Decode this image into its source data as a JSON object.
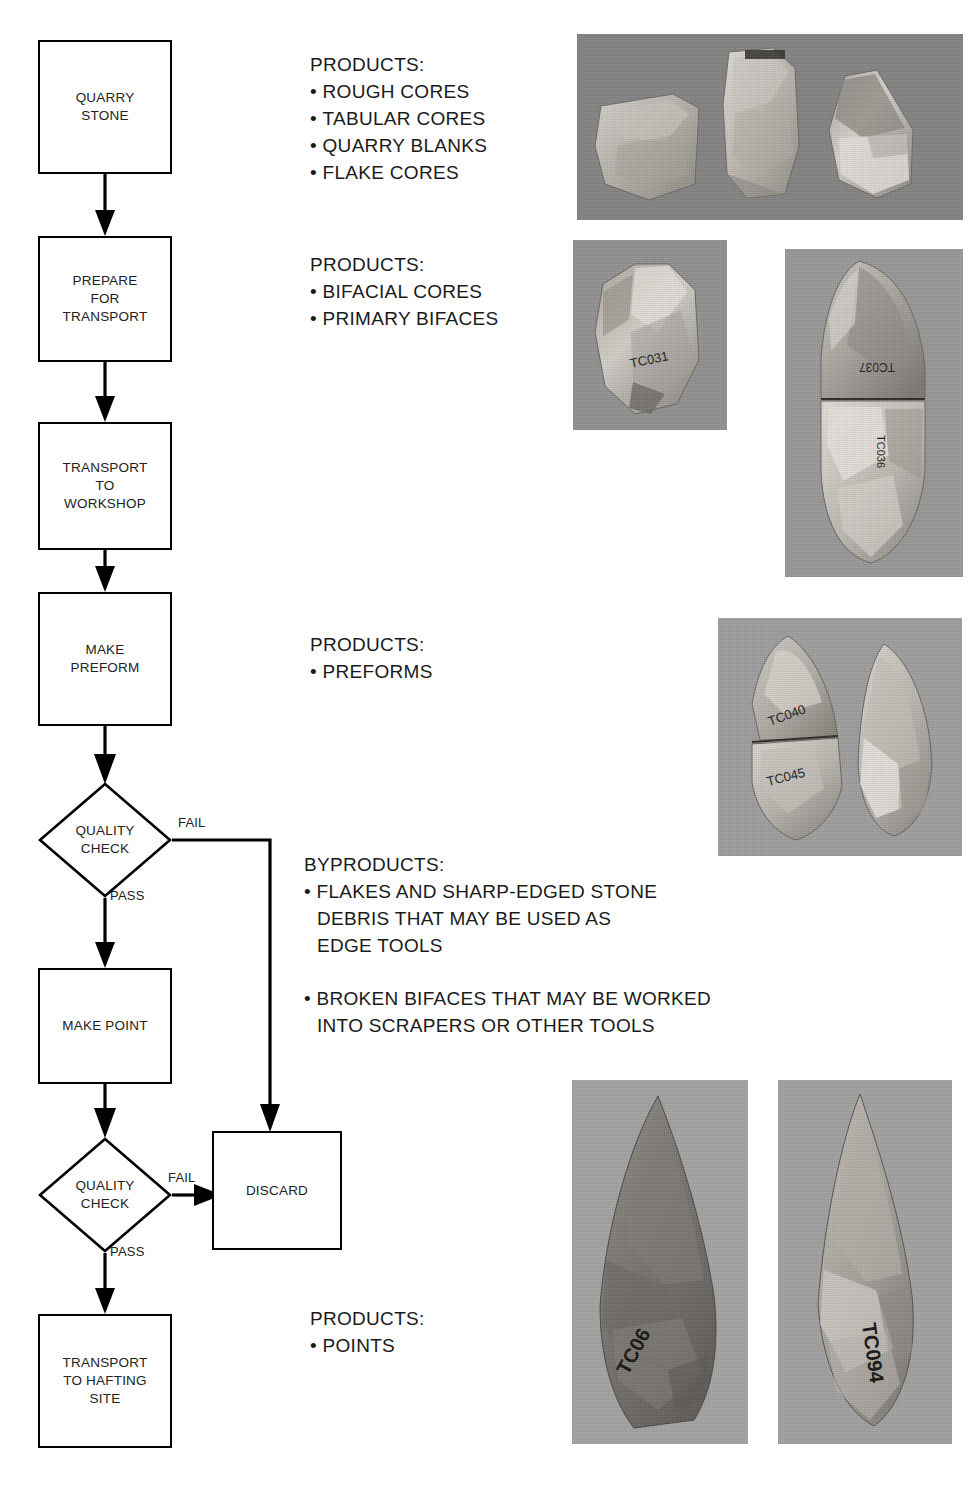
{
  "diagram": {
    "type": "flowchart",
    "orientation": "vertical",
    "nodes": [
      {
        "id": "quarry_stone",
        "shape": "process",
        "label": "QUARRY\nSTONE"
      },
      {
        "id": "prepare_transport",
        "shape": "process",
        "label": "PREPARE\nFOR\nTRANSPORT"
      },
      {
        "id": "transport_workshop",
        "shape": "process",
        "label": "TRANSPORT\nTO\nWORKSHOP"
      },
      {
        "id": "make_preform",
        "shape": "process",
        "label": "MAKE\nPREFORM"
      },
      {
        "id": "quality_check_1",
        "shape": "decision",
        "label": "QUALITY\nCHECK"
      },
      {
        "id": "make_point",
        "shape": "process",
        "label": "MAKE POINT"
      },
      {
        "id": "quality_check_2",
        "shape": "decision",
        "label": "QUALITY\nCHECK"
      },
      {
        "id": "discard",
        "shape": "process",
        "label": "DISCARD"
      },
      {
        "id": "transport_hafting",
        "shape": "process",
        "label": "TRANSPORT\nTO HAFTING\nSITE"
      }
    ],
    "edges": [
      {
        "from": "quarry_stone",
        "to": "prepare_transport",
        "label": ""
      },
      {
        "from": "prepare_transport",
        "to": "transport_workshop",
        "label": ""
      },
      {
        "from": "transport_workshop",
        "to": "make_preform",
        "label": ""
      },
      {
        "from": "make_preform",
        "to": "quality_check_1",
        "label": ""
      },
      {
        "from": "quality_check_1",
        "to": "discard",
        "label": "FAIL"
      },
      {
        "from": "quality_check_1",
        "to": "make_point",
        "label": "PASS"
      },
      {
        "from": "make_point",
        "to": "quality_check_2",
        "label": ""
      },
      {
        "from": "quality_check_2",
        "to": "discard",
        "label": "FAIL"
      },
      {
        "from": "quality_check_2",
        "to": "transport_hafting",
        "label": "PASS"
      }
    ],
    "edge_labels": {
      "fail_1": "FAIL",
      "pass_1": "PASS",
      "fail_2": "FAIL",
      "pass_2": "PASS"
    }
  },
  "annotations": [
    {
      "id": "products_quarry",
      "heading": "PRODUCTS:",
      "items": [
        "ROUGH CORES",
        "TABULAR CORES",
        "QUARRY BLANKS",
        "FLAKE CORES"
      ]
    },
    {
      "id": "products_prepare",
      "heading": "PRODUCTS:",
      "items": [
        "BIFACIAL CORES",
        "PRIMARY BIFACES"
      ]
    },
    {
      "id": "products_preform",
      "heading": "PRODUCTS:",
      "items": [
        "PREFORMS"
      ]
    },
    {
      "id": "byproducts",
      "heading": "BYPRODUCTS:",
      "items": [
        "FLAKES AND SHARP-EDGED STONE\nDEBRIS THAT MAY BE USED AS\nEDGE TOOLS",
        "BROKEN BIFACES THAT MAY BE WORKED\nINTO SCRAPERS OR OTHER TOOLS"
      ]
    },
    {
      "id": "products_points",
      "heading": "PRODUCTS:",
      "items": [
        "POINTS"
      ]
    }
  ],
  "photos": [
    {
      "id": "photo-rough-cores",
      "caption_ref": "ROUGH CORES / TABULAR CORES / QUARRY BLANKS / FLAKE CORES",
      "description": "Three angular quarried stone cores on a gray background",
      "specimen_marks": [],
      "background_hex": "#8a8a8a"
    },
    {
      "id": "photo-bifacial-core",
      "caption_ref": "BIFACIAL CORES",
      "description": "Single bifacial core fragment with ink catalog number",
      "specimen_marks": [
        "TC031"
      ],
      "background_hex": "#939393"
    },
    {
      "id": "photo-primary-biface",
      "caption_ref": "PRIMARY BIFACES",
      "description": "Large leaf-shaped primary biface, refitted break line across the middle",
      "specimen_marks": [
        "TC037",
        "TC036"
      ],
      "background_hex": "#9a9a9a"
    },
    {
      "id": "photo-preforms",
      "caption_ref": "PREFORMS",
      "description": "Two teardrop-shaped preforms side by side, left one refitted from two pieces",
      "specimen_marks": [
        "TC040",
        "TC045"
      ],
      "background_hex": "#a0a0a0"
    },
    {
      "id": "photo-point-left",
      "caption_ref": "POINTS",
      "description": "Dark gray finished projectile point, broad triangular blade",
      "specimen_marks": [
        "TC06"
      ],
      "background_hex": "#a5a5a5"
    },
    {
      "id": "photo-point-right",
      "caption_ref": "POINTS",
      "description": "Light gray finished projectile point, narrow leaf-shaped blade",
      "specimen_marks": [
        "TC094"
      ],
      "background_hex": "#a3a3a3"
    }
  ],
  "colors": {
    "stroke": "#000000",
    "text": "#1a1a1a",
    "page_background": "#ffffff"
  }
}
